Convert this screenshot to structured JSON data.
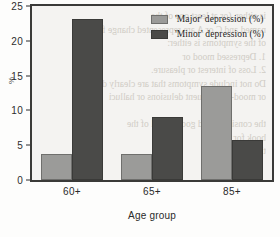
{
  "chart_data": {
    "type": "bar",
    "title": "",
    "subtitle": "",
    "xlabel": "Age group",
    "ylabel": "%",
    "categories": [
      "60+",
      "65+",
      "85+"
    ],
    "series": [
      {
        "name": "'Major' depression (%)",
        "color": "#9b9b99",
        "values": [
          3.7,
          3.8,
          13.5
        ]
      },
      {
        "name": "'Minor' depression (%)",
        "color": "#4a4a48",
        "values": [
          23.2,
          9.0,
          5.7
        ]
      }
    ],
    "ylim": [
      0,
      25
    ],
    "yticks": [
      0,
      5,
      10,
      15,
      20,
      25
    ],
    "ytick_labels": [
      "0",
      "5",
      "10",
      "15",
      "20",
      "25"
    ],
    "grid": false,
    "legend_position": "top-right-inside",
    "frame": true
  },
  "legend": {
    "entries": [
      {
        "label": "'Major' depression (%)",
        "swatch": "major"
      },
      {
        "label": "'Minor' depression (%)",
        "swatch": "minor"
      }
    ]
  },
  "background_bleed": "is either. (or at least one of the\nnamed and C or A are represented change from\nof the symptoms is either:\n1. Depressed mood or\n2. Loss of interest or pleasure.\nDo not include symptoms that are clearly d\nor mood-incongruent delusions or halluci\n\nthe consistent and good for all of the\nbook for the (%)\nthe (%)"
}
